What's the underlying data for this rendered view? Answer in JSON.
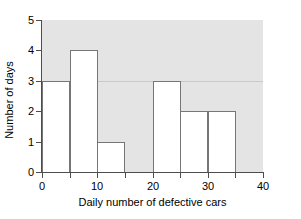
{
  "chart_data": {
    "type": "bar",
    "title": "",
    "xlabel": "Daily number of defective cars",
    "ylabel": "Number of days",
    "bin_width": 5,
    "bin_edges": [
      0,
      5,
      10,
      15,
      20,
      25,
      30,
      35,
      40
    ],
    "categories": [
      "0-5",
      "5-10",
      "10-15",
      "15-20",
      "20-25",
      "25-30",
      "30-35",
      "35-40"
    ],
    "values": [
      3,
      4,
      1,
      0,
      3,
      2,
      2,
      0
    ],
    "xlim": [
      0,
      40
    ],
    "ylim": [
      0,
      5
    ],
    "xticks": [
      0,
      5,
      10,
      15,
      20,
      25,
      30,
      35,
      40
    ],
    "xtick_labels": [
      "0",
      "",
      "10",
      "",
      "20",
      "",
      "30",
      "",
      "40"
    ],
    "yticks": [
      0,
      1,
      2,
      3,
      4,
      5
    ],
    "ytick_labels": [
      "0",
      "1",
      "2",
      "3",
      "4",
      "5"
    ],
    "grid": true,
    "gridlines_y": [
      3
    ],
    "legend": null,
    "colors": {
      "plot_background": "#e4e4e4",
      "bar_fill": "#ffffff",
      "bar_edge": "#767676",
      "axis": "#4d4d4d",
      "gridline": "#c9c9c9",
      "text": "#000000",
      "figure_background": "#ffffff"
    }
  }
}
